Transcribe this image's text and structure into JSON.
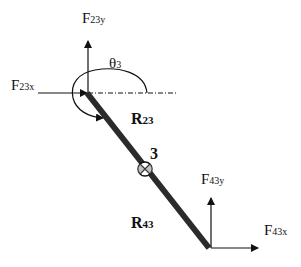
{
  "diagram": {
    "colors": {
      "background": "#ffffff",
      "ink": "#111111",
      "link": "#2b2b2b"
    },
    "link": {
      "label": "3",
      "start": [
        87,
        93
      ],
      "end": [
        209,
        248
      ],
      "center_of_mass_symbol": "circled-x",
      "center_of_mass": [
        145,
        169
      ]
    },
    "angle": {
      "symbol": "θ",
      "subscript": "3"
    },
    "forces": {
      "f23x": {
        "main": "F",
        "sub": "23x"
      },
      "f23y": {
        "main": "F",
        "sub": "23y"
      },
      "f43x": {
        "main": "F",
        "sub": "43x"
      },
      "f43y": {
        "main": "F",
        "sub": "43y"
      }
    },
    "vectors": {
      "r23": {
        "main": "R",
        "sub": "23"
      },
      "r43": {
        "main": "R",
        "sub": "43"
      }
    }
  }
}
